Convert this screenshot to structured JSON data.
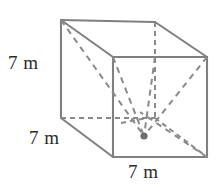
{
  "figure": {
    "name": "rectangular-prism-with-diagonals",
    "background_color": "#ffffff",
    "stroke_color": "#808080",
    "hidden_stroke_color": "#8a8a8a",
    "dot_color": "#6e6e6e",
    "text_color": "#2b2b2b",
    "labels": {
      "height": "7 m",
      "depth": "7 m",
      "width": "7 m"
    },
    "geometry": {
      "back_top_left": [
        61,
        20
      ],
      "back_top_right": [
        155,
        22
      ],
      "front_top_left": [
        113,
        57
      ],
      "front_top_right": [
        207,
        57
      ],
      "back_bottom_left": [
        61,
        118
      ],
      "back_bottom_right": [
        155,
        118
      ],
      "front_bottom_left": [
        113,
        157
      ],
      "front_bottom_right": [
        207,
        157
      ],
      "apex_point": [
        144,
        136
      ],
      "base_center": [
        147,
        118
      ]
    }
  }
}
